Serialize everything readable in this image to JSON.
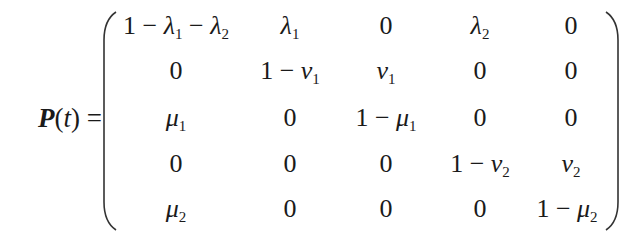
{
  "equation": {
    "lhs": {
      "symbol": "P",
      "open": "(",
      "arg": "t",
      "close": ")",
      "equals": "="
    },
    "matrix": {
      "rows": [
        [
          "1 − λ1 − λ2",
          "λ1",
          "0",
          "λ2",
          "0"
        ],
        [
          "0",
          "1 − ν1",
          "ν1",
          "0",
          "0"
        ],
        [
          "μ1",
          "0",
          "1 − μ1",
          "0",
          "0"
        ],
        [
          "0",
          "0",
          "0",
          "1 − ν2",
          "ν2"
        ],
        [
          "μ2",
          "0",
          "0",
          "0",
          "1 − μ2"
        ]
      ]
    }
  },
  "cells": {
    "r0c0": {
      "a": "1 − ",
      "b": "λ",
      "s": "1",
      "c": " − ",
      "d": "λ",
      "e": "2"
    },
    "r0c1": {
      "v": "λ",
      "s": "1"
    },
    "r0c2": {
      "v": "0"
    },
    "r0c3": {
      "v": "λ",
      "s": "2"
    },
    "r0c4": {
      "v": "0"
    },
    "r1c0": {
      "v": "0"
    },
    "r1c1": {
      "p": "1 − ",
      "v": "ν",
      "s": "1"
    },
    "r1c2": {
      "v": "ν",
      "s": "1"
    },
    "r1c3": {
      "v": "0"
    },
    "r1c4": {
      "v": "0"
    },
    "r2c0": {
      "v": "μ",
      "s": "1"
    },
    "r2c1": {
      "v": "0"
    },
    "r2c2": {
      "p": "1 − ",
      "v": "μ",
      "s": "1"
    },
    "r2c3": {
      "v": "0"
    },
    "r2c4": {
      "v": "0"
    },
    "r3c0": {
      "v": "0"
    },
    "r3c1": {
      "v": "0"
    },
    "r3c2": {
      "v": "0"
    },
    "r3c3": {
      "p": "1 − ",
      "v": "ν",
      "s": "2"
    },
    "r3c4": {
      "v": "ν",
      "s": "2"
    },
    "r4c0": {
      "v": "μ",
      "s": "2"
    },
    "r4c1": {
      "v": "0"
    },
    "r4c2": {
      "v": "0"
    },
    "r4c3": {
      "v": "0"
    },
    "r4c4": {
      "p": "1 − ",
      "v": "μ",
      "s": "2"
    }
  }
}
